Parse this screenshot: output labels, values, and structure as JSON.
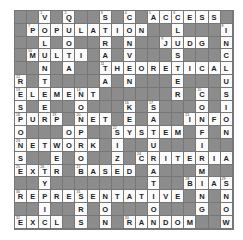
{
  "puzzle": {
    "cols": 18,
    "rows": 17,
    "colors": {
      "block": "#8c8c8c",
      "open": "#fbfbfb",
      "letter": "#222222"
    },
    "cells": [
      {
        "r": 0,
        "c": 2,
        "l": "V",
        "n": "1"
      },
      {
        "r": 0,
        "c": 4,
        "l": "Q",
        "n": "2"
      },
      {
        "r": 0,
        "c": 7,
        "l": "S",
        "n": "3"
      },
      {
        "r": 0,
        "c": 9,
        "l": "C",
        "n": "4"
      },
      {
        "r": 0,
        "c": 11,
        "l": "A",
        "n": "5"
      },
      {
        "r": 0,
        "c": 12,
        "l": "C"
      },
      {
        "r": 0,
        "c": 13,
        "l": "C",
        "n": "6"
      },
      {
        "r": 0,
        "c": 14,
        "l": "E"
      },
      {
        "r": 0,
        "c": 15,
        "l": "S"
      },
      {
        "r": 0,
        "c": 16,
        "l": "S"
      },
      {
        "r": 1,
        "c": 1,
        "l": "P",
        "n": "7"
      },
      {
        "r": 1,
        "c": 2,
        "l": "O"
      },
      {
        "r": 1,
        "c": 3,
        "l": "P"
      },
      {
        "r": 1,
        "c": 4,
        "l": "U"
      },
      {
        "r": 1,
        "c": 5,
        "l": "L"
      },
      {
        "r": 1,
        "c": 6,
        "l": "A"
      },
      {
        "r": 1,
        "c": 7,
        "l": "T"
      },
      {
        "r": 1,
        "c": 8,
        "l": "I"
      },
      {
        "r": 1,
        "c": 9,
        "l": "O"
      },
      {
        "r": 1,
        "c": 10,
        "l": "N"
      },
      {
        "r": 1,
        "c": 13,
        "l": "L"
      },
      {
        "r": 1,
        "c": 17,
        "l": "I",
        "n": "8"
      },
      {
        "r": 2,
        "c": 2,
        "l": "L"
      },
      {
        "r": 2,
        "c": 4,
        "l": "O"
      },
      {
        "r": 2,
        "c": 7,
        "l": "R"
      },
      {
        "r": 2,
        "c": 9,
        "l": "N"
      },
      {
        "r": 2,
        "c": 12,
        "l": "J",
        "n": "9"
      },
      {
        "r": 2,
        "c": 13,
        "l": "U"
      },
      {
        "r": 2,
        "c": 14,
        "l": "D"
      },
      {
        "r": 2,
        "c": 15,
        "l": "G"
      },
      {
        "r": 2,
        "c": 17,
        "l": "N"
      },
      {
        "r": 3,
        "c": 1,
        "l": "M",
        "n": "10"
      },
      {
        "r": 3,
        "c": 2,
        "l": "U"
      },
      {
        "r": 3,
        "c": 3,
        "l": "L"
      },
      {
        "r": 3,
        "c": 4,
        "l": "T"
      },
      {
        "r": 3,
        "c": 5,
        "l": "I"
      },
      {
        "r": 3,
        "c": 7,
        "l": "A"
      },
      {
        "r": 3,
        "c": 9,
        "l": "V"
      },
      {
        "r": 3,
        "c": 13,
        "l": "S"
      },
      {
        "r": 3,
        "c": 17,
        "l": "C"
      },
      {
        "r": 4,
        "c": 2,
        "l": "N"
      },
      {
        "r": 4,
        "c": 4,
        "l": "A"
      },
      {
        "r": 4,
        "c": 7,
        "l": "T",
        "n": "11"
      },
      {
        "r": 4,
        "c": 8,
        "l": "H"
      },
      {
        "r": 4,
        "c": 9,
        "l": "E"
      },
      {
        "r": 4,
        "c": 10,
        "l": "O"
      },
      {
        "r": 4,
        "c": 11,
        "l": "R"
      },
      {
        "r": 4,
        "c": 12,
        "l": "E"
      },
      {
        "r": 4,
        "c": 13,
        "l": "T"
      },
      {
        "r": 4,
        "c": 14,
        "l": "I"
      },
      {
        "r": 4,
        "c": 15,
        "l": "C"
      },
      {
        "r": 4,
        "c": 16,
        "l": "A"
      },
      {
        "r": 4,
        "c": 17,
        "l": "L"
      },
      {
        "r": 5,
        "c": 0,
        "l": "R",
        "n": "12"
      },
      {
        "r": 5,
        "c": 2,
        "l": "T"
      },
      {
        "r": 5,
        "c": 7,
        "l": "A"
      },
      {
        "r": 5,
        "c": 9,
        "l": "N"
      },
      {
        "r": 5,
        "c": 13,
        "l": "E"
      },
      {
        "r": 5,
        "c": 17,
        "l": "U"
      },
      {
        "r": 6,
        "c": 0,
        "l": "E",
        "n": "13"
      },
      {
        "r": 6,
        "c": 1,
        "l": "L"
      },
      {
        "r": 6,
        "c": 2,
        "l": "E"
      },
      {
        "r": 6,
        "c": 3,
        "l": "M"
      },
      {
        "r": 6,
        "c": 4,
        "l": "E"
      },
      {
        "r": 6,
        "c": 5,
        "l": "N",
        "n": "14"
      },
      {
        "r": 6,
        "c": 6,
        "l": "T"
      },
      {
        "r": 6,
        "c": 13,
        "l": "R"
      },
      {
        "r": 6,
        "c": 15,
        "l": "C",
        "n": "15"
      },
      {
        "r": 6,
        "c": 17,
        "l": "S"
      },
      {
        "r": 7,
        "c": 0,
        "l": "S"
      },
      {
        "r": 7,
        "c": 2,
        "l": "E"
      },
      {
        "r": 7,
        "c": 5,
        "l": "O"
      },
      {
        "r": 7,
        "c": 9,
        "l": "K",
        "n": "16"
      },
      {
        "r": 7,
        "c": 11,
        "l": "S",
        "n": "17"
      },
      {
        "r": 7,
        "c": 15,
        "l": "O"
      },
      {
        "r": 7,
        "c": 17,
        "l": "I"
      },
      {
        "r": 8,
        "c": 0,
        "l": "P",
        "n": "18"
      },
      {
        "r": 8,
        "c": 1,
        "l": "U"
      },
      {
        "r": 8,
        "c": 2,
        "l": "R"
      },
      {
        "r": 8,
        "c": 3,
        "l": "P",
        "n": "19"
      },
      {
        "r": 8,
        "c": 5,
        "l": "N",
        "n": "20"
      },
      {
        "r": 8,
        "c": 6,
        "l": "E"
      },
      {
        "r": 8,
        "c": 7,
        "l": "T"
      },
      {
        "r": 8,
        "c": 9,
        "l": "E"
      },
      {
        "r": 8,
        "c": 11,
        "l": "A"
      },
      {
        "r": 8,
        "c": 14,
        "l": "I",
        "n": "21"
      },
      {
        "r": 8,
        "c": 15,
        "l": "N"
      },
      {
        "r": 8,
        "c": 16,
        "l": "F"
      },
      {
        "r": 8,
        "c": 17,
        "l": "O"
      },
      {
        "r": 9,
        "c": 0,
        "l": "O"
      },
      {
        "r": 9,
        "c": 4,
        "l": "O"
      },
      {
        "r": 9,
        "c": 5,
        "l": "P"
      },
      {
        "r": 9,
        "c": 8,
        "l": "S",
        "n": "22"
      },
      {
        "r": 9,
        "c": 9,
        "l": "Y"
      },
      {
        "r": 9,
        "c": 10,
        "l": "S"
      },
      {
        "r": 9,
        "c": 11,
        "l": "T"
      },
      {
        "r": 9,
        "c": 12,
        "l": "E"
      },
      {
        "r": 9,
        "c": 13,
        "l": "M"
      },
      {
        "r": 9,
        "c": 15,
        "l": "F"
      },
      {
        "r": 9,
        "c": 17,
        "l": "N"
      },
      {
        "r": 10,
        "c": 0,
        "l": "N",
        "n": "23"
      },
      {
        "r": 10,
        "c": 1,
        "l": "E"
      },
      {
        "r": 10,
        "c": 2,
        "l": "T"
      },
      {
        "r": 10,
        "c": 3,
        "l": "W"
      },
      {
        "r": 10,
        "c": 4,
        "l": "O"
      },
      {
        "r": 10,
        "c": 5,
        "l": "R"
      },
      {
        "r": 10,
        "c": 6,
        "l": "K"
      },
      {
        "r": 10,
        "c": 8,
        "l": "I"
      },
      {
        "r": 10,
        "c": 11,
        "l": "U"
      },
      {
        "r": 10,
        "c": 15,
        "l": "I"
      },
      {
        "r": 11,
        "c": 0,
        "l": "S"
      },
      {
        "r": 11,
        "c": 3,
        "l": "E"
      },
      {
        "r": 11,
        "c": 5,
        "l": "O"
      },
      {
        "r": 11,
        "c": 8,
        "l": "Z"
      },
      {
        "r": 11,
        "c": 10,
        "l": "C",
        "n": "24"
      },
      {
        "r": 11,
        "c": 11,
        "l": "R"
      },
      {
        "r": 11,
        "c": 12,
        "l": "I"
      },
      {
        "r": 11,
        "c": 13,
        "l": "T"
      },
      {
        "r": 11,
        "c": 14,
        "l": "E"
      },
      {
        "r": 11,
        "c": 15,
        "l": "R"
      },
      {
        "r": 11,
        "c": 16,
        "l": "I"
      },
      {
        "r": 11,
        "c": 17,
        "l": "A"
      },
      {
        "r": 12,
        "c": 0,
        "l": "E",
        "n": "25"
      },
      {
        "r": 12,
        "c": 1,
        "l": "X"
      },
      {
        "r": 12,
        "c": 2,
        "l": "T",
        "n": "26"
      },
      {
        "r": 12,
        "c": 3,
        "l": "R"
      },
      {
        "r": 12,
        "c": 5,
        "l": "B",
        "n": "27"
      },
      {
        "r": 12,
        "c": 6,
        "l": "A"
      },
      {
        "r": 12,
        "c": 7,
        "l": "S"
      },
      {
        "r": 12,
        "c": 8,
        "l": "E"
      },
      {
        "r": 12,
        "c": 9,
        "l": "D"
      },
      {
        "r": 12,
        "c": 11,
        "l": "A"
      },
      {
        "r": 12,
        "c": 15,
        "l": "M"
      },
      {
        "r": 13,
        "c": 2,
        "l": "Y"
      },
      {
        "r": 13,
        "c": 11,
        "l": "T"
      },
      {
        "r": 13,
        "c": 14,
        "l": "B",
        "n": "28"
      },
      {
        "r": 13,
        "c": 15,
        "l": "I"
      },
      {
        "r": 13,
        "c": 16,
        "l": "A"
      },
      {
        "r": 13,
        "c": 17,
        "l": "S",
        "n": "29"
      },
      {
        "r": 14,
        "c": 0,
        "l": "R",
        "n": "30"
      },
      {
        "r": 14,
        "c": 1,
        "l": "E"
      },
      {
        "r": 14,
        "c": 2,
        "l": "P"
      },
      {
        "r": 14,
        "c": 3,
        "l": "R"
      },
      {
        "r": 14,
        "c": 4,
        "l": "E"
      },
      {
        "r": 14,
        "c": 5,
        "l": "S",
        "n": "31"
      },
      {
        "r": 14,
        "c": 6,
        "l": "E"
      },
      {
        "r": 14,
        "c": 7,
        "l": "N"
      },
      {
        "r": 14,
        "c": 8,
        "l": "T"
      },
      {
        "r": 14,
        "c": 9,
        "l": "A"
      },
      {
        "r": 14,
        "c": 10,
        "l": "T"
      },
      {
        "r": 14,
        "c": 11,
        "l": "I"
      },
      {
        "r": 14,
        "c": 12,
        "l": "V"
      },
      {
        "r": 14,
        "c": 13,
        "l": "E"
      },
      {
        "r": 14,
        "c": 15,
        "l": "N"
      },
      {
        "r": 14,
        "c": 17,
        "l": "N"
      },
      {
        "r": 15,
        "c": 2,
        "l": "I"
      },
      {
        "r": 15,
        "c": 5,
        "l": "R"
      },
      {
        "r": 15,
        "c": 7,
        "l": "O"
      },
      {
        "r": 15,
        "c": 11,
        "l": "O"
      },
      {
        "r": 15,
        "c": 15,
        "l": "G"
      },
      {
        "r": 15,
        "c": 17,
        "l": "O"
      },
      {
        "r": 16,
        "c": 0,
        "l": "E",
        "n": "32"
      },
      {
        "r": 16,
        "c": 1,
        "l": "X"
      },
      {
        "r": 16,
        "c": 2,
        "l": "C"
      },
      {
        "r": 16,
        "c": 3,
        "l": "L"
      },
      {
        "r": 16,
        "c": 5,
        "l": "S"
      },
      {
        "r": 16,
        "c": 7,
        "l": "N"
      },
      {
        "r": 16,
        "c": 9,
        "l": "R",
        "n": "33"
      },
      {
        "r": 16,
        "c": 10,
        "l": "A"
      },
      {
        "r": 16,
        "c": 11,
        "l": "N"
      },
      {
        "r": 16,
        "c": 12,
        "l": "D"
      },
      {
        "r": 16,
        "c": 13,
        "l": "O"
      },
      {
        "r": 16,
        "c": 14,
        "l": "M"
      },
      {
        "r": 16,
        "c": 17,
        "l": "W"
      }
    ]
  }
}
